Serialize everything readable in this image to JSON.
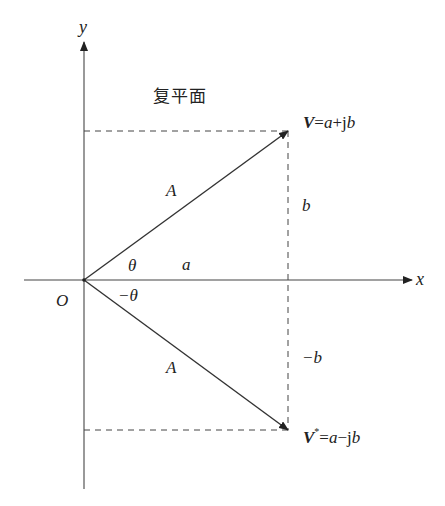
{
  "diagram": {
    "title": "复平面",
    "axes": {
      "x_label": "x",
      "y_label": "y",
      "origin_label": "O"
    },
    "vectors": {
      "v": {
        "symbol": "V",
        "eq": "=",
        "expr_a": "a",
        "expr_op": "+",
        "expr_j": "j",
        "expr_b": "b"
      },
      "v_conj": {
        "symbol": "V",
        "sup": "*",
        "eq": "=",
        "expr_a": "a",
        "expr_op": "−",
        "expr_j": "j",
        "expr_b": "b"
      }
    },
    "labels": {
      "magnitude_upper": "A",
      "magnitude_lower": "A",
      "angle_upper": "θ",
      "angle_lower": "−θ",
      "real_part": "a",
      "imag_upper": "b",
      "imag_lower": "−b"
    },
    "colors": {
      "line": "#333333",
      "axis": "#555555",
      "text": "#222222"
    }
  }
}
